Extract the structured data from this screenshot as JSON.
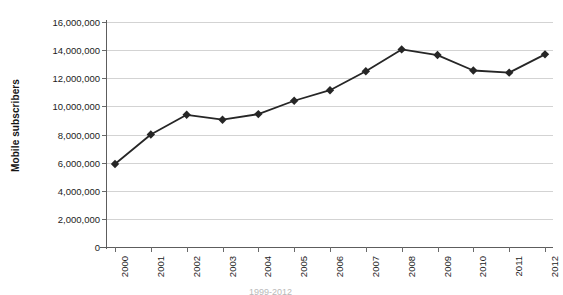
{
  "chart_data": {
    "type": "line",
    "title": "",
    "xlabel": "",
    "ylabel": "Mobile subscribers",
    "categories": [
      "2000",
      "2001",
      "2002",
      "2003",
      "2004",
      "2005",
      "2006",
      "2007",
      "2008",
      "2009",
      "2010",
      "2011",
      "2012"
    ],
    "values": [
      5900000,
      8000000,
      9400000,
      9050000,
      9450000,
      10400000,
      11150000,
      12500000,
      14050000,
      13650000,
      12550000,
      12400000,
      13700000
    ],
    "series": [
      {
        "name": "Mobile subscribers",
        "values": [
          5900000,
          8000000,
          9400000,
          9050000,
          9450000,
          10400000,
          11150000,
          12500000,
          14050000,
          13650000,
          12550000,
          12400000,
          13700000
        ]
      }
    ],
    "ylim": [
      0,
      16000000
    ],
    "ytick_values": [
      0,
      2000000,
      4000000,
      6000000,
      8000000,
      10000000,
      12000000,
      14000000,
      16000000
    ],
    "ytick_labels": [
      "0",
      "2,000,000",
      "4,000,000",
      "6,000,000",
      "8,000,000",
      "10,000,000",
      "12,000,000",
      "14,000,000",
      "16,000,000"
    ],
    "grid": "horizontal",
    "legend": "none",
    "marker": "diamond",
    "line_color": "#262626",
    "marker_color": "#262626",
    "gridline_color": "#d3d3d3",
    "axis_color": "#5d5d5d",
    "background_color": "#ffffff"
  },
  "axes": {
    "y_title": "Mobile subscribers"
  },
  "caption": {
    "clipped_text": "1999-2012"
  }
}
